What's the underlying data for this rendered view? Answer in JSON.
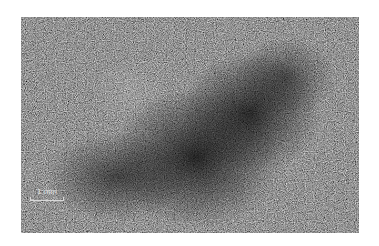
{
  "figure": {
    "scale_bar": {
      "label": "1 mm"
    }
  }
}
